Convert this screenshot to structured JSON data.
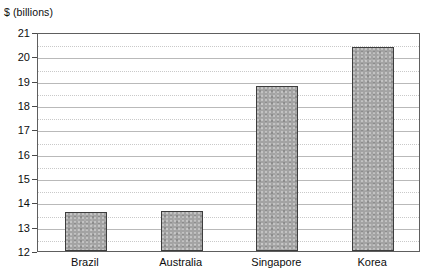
{
  "chart_data": {
    "type": "bar",
    "title": "$ (billions)",
    "xlabel": "",
    "ylabel": "$ (billions)",
    "categories": [
      "Brazil",
      "Australia",
      "Singapore",
      "Korea"
    ],
    "values": [
      13.6,
      13.65,
      18.8,
      20.4
    ],
    "series": [
      {
        "name": "$ (billions)",
        "values": [
          13.6,
          13.65,
          18.8,
          20.4
        ]
      }
    ],
    "ylim": [
      12,
      21
    ],
    "y_major_ticks": [
      12,
      13,
      14,
      15,
      16,
      17,
      18,
      19,
      20,
      21
    ],
    "y_minor_ticks": [
      12.5,
      13.5,
      14.5,
      15.5,
      16.5,
      17.5,
      18.5,
      19.5,
      20.5
    ],
    "y_tick_labels": [
      "12",
      "13",
      "14",
      "15",
      "16",
      "17",
      "18",
      "19",
      "20",
      "21"
    ],
    "grid": true,
    "grid_major_style": "solid",
    "grid_minor_style": "dotted",
    "legend": false,
    "legend_position": "none",
    "bar_color": "#a3a3a3",
    "bar_edge_color": "#3d3d3d",
    "frame_color": "#5e5e5e",
    "grid_major_color": "#b9b9b9",
    "grid_minor_color": "#c9c9c9",
    "text_color": "#0d0d0d",
    "background_color": "#ffffff"
  }
}
